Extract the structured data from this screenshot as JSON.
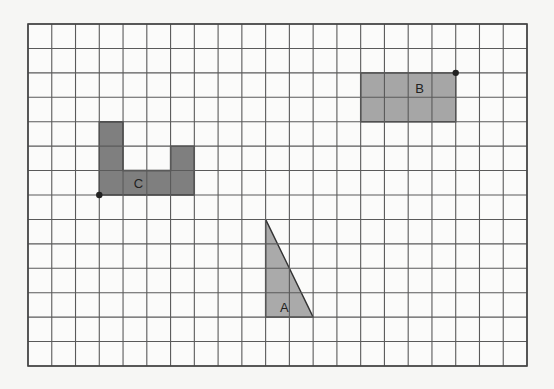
{
  "grid": {
    "left": 28,
    "top": 24,
    "right": 527,
    "bottom": 366,
    "cols": 21,
    "rows": 14,
    "line_color": "#5a5a5a",
    "border_color": "#444444",
    "background": "#fbfbfa"
  },
  "shapes": [
    {
      "id": "C",
      "label": "C",
      "fill": "#7f7f7f",
      "cells": [
        [
          3,
          4
        ],
        [
          4,
          4
        ],
        [
          5,
          4
        ],
        [
          6,
          4
        ],
        [
          3,
          5
        ],
        [
          3,
          6
        ],
        [
          4,
          6
        ],
        [
          5,
          6
        ],
        [
          6,
          6
        ],
        [
          6,
          5
        ]
      ],
      "polygon": [
        [
          3,
          4
        ],
        [
          4,
          4
        ],
        [
          4,
          6
        ],
        [
          6,
          6
        ],
        [
          6,
          5
        ],
        [
          7,
          5
        ],
        [
          7,
          7
        ],
        [
          3,
          7
        ]
      ],
      "label_pos": [
        4.45,
        6.5
      ],
      "dot": [
        3,
        7
      ]
    },
    {
      "id": "B",
      "label": "B",
      "fill": "#a6a6a6",
      "polygon": [
        [
          14,
          2
        ],
        [
          18,
          2
        ],
        [
          18,
          4
        ],
        [
          14,
          4
        ]
      ],
      "label_pos": [
        16.3,
        2.6
      ],
      "dot": [
        18,
        2
      ]
    },
    {
      "id": "A",
      "label": "A",
      "fill": "#aaaaaa",
      "polygon": [
        [
          10,
          8
        ],
        [
          12,
          12
        ],
        [
          10,
          12
        ]
      ],
      "label_pos": [
        10.6,
        11.6
      ],
      "dot": null
    }
  ],
  "dot_color": "#222222"
}
